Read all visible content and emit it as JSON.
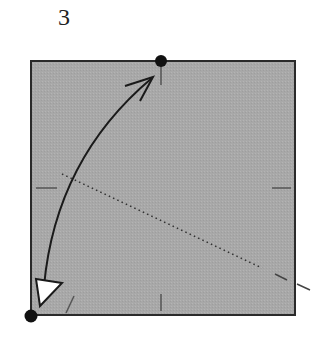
{
  "diagram": {
    "step_number": "3",
    "paper_color": "#a9a9a9",
    "line_color": "#1a1a1a",
    "square": {
      "x": 31,
      "y": 61,
      "width": 264,
      "height": 254
    },
    "reference_points": [
      {
        "name": "top-center-point",
        "x": 161,
        "y": 61
      },
      {
        "name": "bottom-left-corner-point",
        "x": 31,
        "y": 316
      }
    ],
    "fold_line": {
      "style": "dotted",
      "from": [
        62,
        174
      ],
      "to": [
        262,
        268
      ]
    },
    "fold_arrow": {
      "from": "bottom-left corner",
      "to": "top-center point"
    }
  }
}
